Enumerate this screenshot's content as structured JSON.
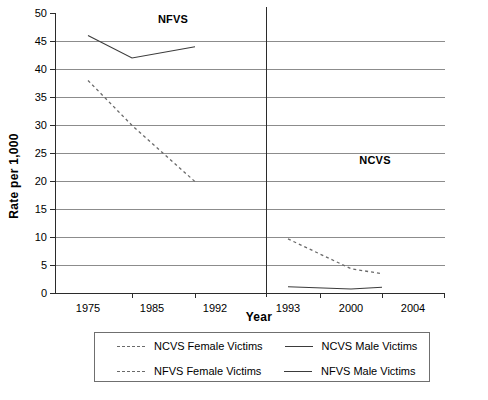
{
  "chart_data": {
    "type": "line",
    "title": "",
    "xlabel": "Year",
    "ylabel": "Rate per 1,000",
    "ylim": [
      0,
      50
    ],
    "yticks": [
      0,
      5,
      10,
      15,
      20,
      25,
      30,
      35,
      40,
      45,
      50
    ],
    "ytick_labels": [
      "0",
      "5",
      "10",
      "15",
      "20",
      "25",
      "30",
      "35",
      "40",
      "45",
      "50"
    ],
    "grid": "horizontal",
    "legend_position": "below-axes",
    "panels": [
      {
        "name": "NFVS",
        "annotation": "NFVS",
        "xtick_labels": [
          "1975",
          "1985",
          "1992"
        ]
      },
      {
        "name": "NCVS",
        "annotation": "NCVS",
        "xtick_labels": [
          "1993",
          "2000",
          "2004"
        ]
      }
    ],
    "xtick_labels": [
      "1975",
      "1985",
      "1992",
      "1993",
      "2000",
      "2004"
    ],
    "series": [
      {
        "name": "NFVS Male Victims",
        "style": "solid",
        "color": "#3b3b3b",
        "panel": "NFVS",
        "x": [
          "1975",
          "1985",
          "1992"
        ],
        "values": [
          46.0,
          42.0,
          44.0
        ]
      },
      {
        "name": "NFVS Female Victims",
        "style": "dashed",
        "color": "#6a6a6a",
        "panel": "NFVS",
        "x": [
          "1975",
          "1985",
          "1992"
        ],
        "values": [
          38.0,
          30.0,
          20.0
        ]
      },
      {
        "name": "NCVS Male Victims",
        "style": "solid",
        "color": "#3b3b3b",
        "panel": "NCVS",
        "x": [
          "1993",
          "2000",
          "2004"
        ],
        "values": [
          1.3,
          0.9,
          1.2
        ]
      },
      {
        "name": "NCVS Female Victims",
        "style": "dashed",
        "color": "#6a6a6a",
        "panel": "NCVS",
        "x": [
          "1993",
          "2000",
          "2004"
        ],
        "values": [
          9.8,
          4.5,
          3.6
        ]
      }
    ],
    "legend": [
      {
        "label": "NCVS Female Victims",
        "style": "dashed"
      },
      {
        "label": "NCVS Male Victims",
        "style": "solid"
      },
      {
        "label": "NFVS Female Victims",
        "style": "dashed"
      },
      {
        "label": "NFVS Male Victims",
        "style": "solid"
      }
    ]
  }
}
